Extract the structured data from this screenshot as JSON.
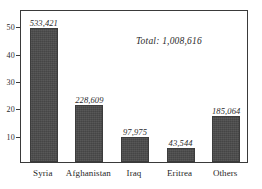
{
  "chart_data": {
    "type": "bar",
    "title": "",
    "subtitle": "",
    "xlabel": "",
    "ylabel": "",
    "categories": [
      "Syria",
      "Afghanistan",
      "Iraq",
      "Eritrea",
      "Others"
    ],
    "values": [
      49,
      21,
      9,
      5,
      17
    ],
    "data_labels": [
      "533,421",
      "228,609",
      "97,975",
      "43,544",
      "185,064"
    ],
    "raw_values": [
      533421,
      228609,
      97975,
      43544,
      185064
    ],
    "ylim": [
      0,
      56
    ],
    "yticks": [
      10,
      20,
      30,
      40,
      50
    ],
    "ytick_labels": [
      "10",
      "20",
      "30",
      "40",
      "50"
    ],
    "grid": false,
    "legend": null,
    "legend_position": "none",
    "annotations": [
      {
        "name": "total",
        "text": "Total: 1,008,616",
        "total_value": 1008616
      }
    ],
    "bar_color": "#4a4a4a",
    "frame_color": "#3a3a3a",
    "background_color": "#ffffff"
  }
}
